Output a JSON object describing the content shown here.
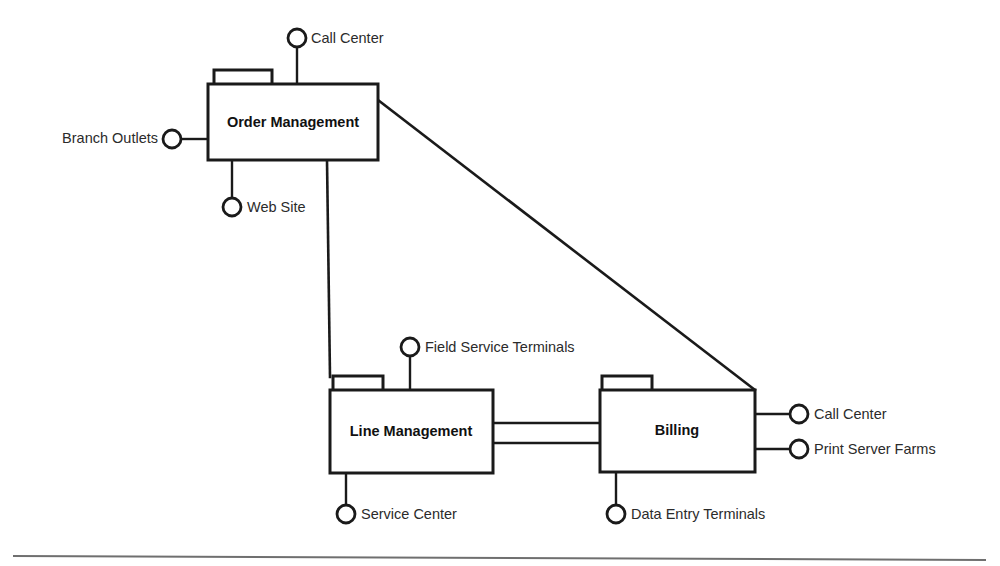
{
  "diagram": {
    "type": "uml-component-diagram",
    "title": "",
    "background_color": "#ffffff",
    "line_color": "#1a1a1a",
    "rule_color": "#6f6f6f",
    "components": [
      {
        "id": "order-management",
        "label": "Order Management",
        "x": 208,
        "y": 84,
        "w": 170,
        "h": 76,
        "tab": {
          "x": 214,
          "y": 70,
          "w": 58,
          "h": 14
        }
      },
      {
        "id": "line-management",
        "label": "Line Management",
        "x": 330,
        "y": 390,
        "w": 163,
        "h": 83,
        "tab": {
          "x": 333,
          "y": 376,
          "w": 50,
          "h": 14
        }
      },
      {
        "id": "billing",
        "label": "Billing",
        "x": 600,
        "y": 390,
        "w": 155,
        "h": 82,
        "tab": {
          "x": 602,
          "y": 376,
          "w": 50,
          "h": 14
        }
      }
    ],
    "interfaces": [
      {
        "id": "call-center-top",
        "label": "Call Center",
        "cx": 297,
        "cy": 38,
        "r": 9,
        "label_x": 311,
        "label_y": 39,
        "align": "right",
        "stem": {
          "x1": 297,
          "y1": 47,
          "x2": 297,
          "y2": 84
        },
        "attached_to": "order-management"
      },
      {
        "id": "branch-outlets",
        "label": "Branch Outlets",
        "cx": 172,
        "cy": 139,
        "r": 9,
        "label_x": 158,
        "label_y": 139,
        "align": "left",
        "stem": {
          "x1": 181,
          "y1": 139,
          "x2": 208,
          "y2": 139
        },
        "attached_to": "order-management"
      },
      {
        "id": "web-site",
        "label": "Web Site",
        "cx": 232,
        "cy": 207,
        "r": 9,
        "label_x": 247,
        "label_y": 208,
        "align": "right",
        "stem": {
          "x1": 232,
          "y1": 160,
          "x2": 232,
          "y2": 198
        },
        "attached_to": "order-management"
      },
      {
        "id": "field-service-terminals",
        "label": "Field Service Terminals",
        "cx": 410,
        "cy": 347,
        "r": 9,
        "label_x": 425,
        "label_y": 348,
        "align": "right",
        "stem": {
          "x1": 410,
          "y1": 356,
          "x2": 410,
          "y2": 390
        },
        "attached_to": "line-management"
      },
      {
        "id": "service-center",
        "label": "Service Center",
        "cx": 346,
        "cy": 514,
        "r": 9,
        "label_x": 361,
        "label_y": 515,
        "align": "right",
        "stem": {
          "x1": 346,
          "y1": 473,
          "x2": 346,
          "y2": 505
        },
        "attached_to": "line-management"
      },
      {
        "id": "data-entry-terminals",
        "label": "Data Entry Terminals",
        "cx": 616,
        "cy": 514,
        "r": 9,
        "label_x": 631,
        "label_y": 515,
        "align": "right",
        "stem": {
          "x1": 616,
          "y1": 472,
          "x2": 616,
          "y2": 505
        },
        "attached_to": "billing"
      },
      {
        "id": "call-center-billing",
        "label": "Call Center",
        "cx": 799,
        "cy": 414,
        "r": 9,
        "label_x": 814,
        "label_y": 415,
        "align": "right",
        "stem": {
          "x1": 755,
          "y1": 414,
          "x2": 790,
          "y2": 414
        },
        "attached_to": "billing"
      },
      {
        "id": "print-server-farms",
        "label": "Print Server Farms",
        "cx": 799,
        "cy": 449,
        "r": 9,
        "label_x": 814,
        "label_y": 450,
        "align": "right",
        "stem": {
          "x1": 755,
          "y1": 449,
          "x2": 790,
          "y2": 449
        },
        "attached_to": "billing"
      }
    ],
    "connections": [
      {
        "id": "order-to-line",
        "from": "order-management",
        "to": "line-management",
        "points": "327,160 330,377"
      },
      {
        "id": "order-to-billing",
        "from": "order-management",
        "to": "billing",
        "points": "378,100 755,390"
      },
      {
        "id": "line-to-billing-upper",
        "from": "line-management",
        "to": "billing",
        "points": "493,423 600,423"
      },
      {
        "id": "line-to-billing-lower",
        "from": "line-management",
        "to": "billing",
        "points": "493,443 600,443"
      }
    ],
    "footer_rule": {
      "x1": 13,
      "y1": 556,
      "x2": 986,
      "y2": 560
    }
  }
}
